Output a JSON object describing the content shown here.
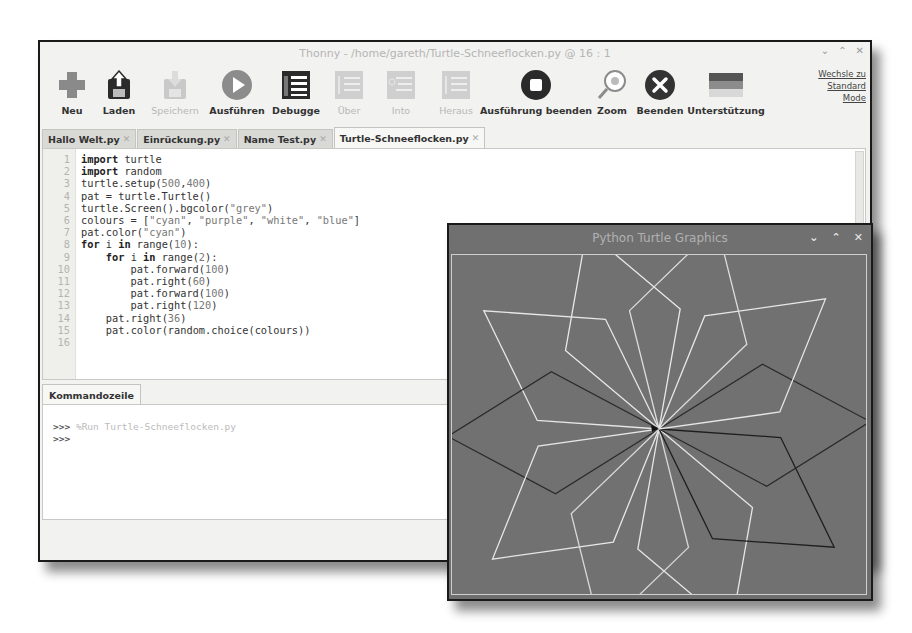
{
  "thonny": {
    "title": "Thonny  -  /home/gareth/Turtle-Schneeflocken.py  @  16 : 1",
    "window_controls": {
      "minimize": "⌄",
      "maximize": "⌃",
      "close": "✕"
    },
    "mode_link": [
      "Wechsle zu",
      "Standard",
      "Mode"
    ],
    "toolbar": [
      {
        "id": "new",
        "label": "Neu",
        "icon": "plus-icon",
        "enabled": true
      },
      {
        "id": "load",
        "label": "Laden",
        "icon": "load-icon",
        "enabled": true
      },
      {
        "id": "save",
        "label": "Speichern",
        "icon": "save-icon",
        "enabled": false
      },
      {
        "id": "run",
        "label": "Ausführen",
        "icon": "play-icon",
        "enabled": true
      },
      {
        "id": "debug",
        "label": "Debugge",
        "icon": "debug-icon",
        "enabled": true
      },
      {
        "id": "step-over",
        "label": "Über",
        "icon": "step-over-icon",
        "enabled": false
      },
      {
        "id": "step-into",
        "label": "Into",
        "icon": "step-into-icon",
        "enabled": false
      },
      {
        "id": "step-out",
        "label": "Heraus",
        "icon": "step-out-icon",
        "enabled": false
      },
      {
        "id": "stop",
        "label": "Ausführung beenden",
        "icon": "stop-icon",
        "enabled": true
      },
      {
        "id": "zoom",
        "label": "Zoom",
        "icon": "zoom-icon",
        "enabled": true
      },
      {
        "id": "quit",
        "label": "Beenden",
        "icon": "quit-icon",
        "enabled": true
      },
      {
        "id": "support",
        "label": "Unterstützung",
        "icon": "flag-icon",
        "enabled": true
      }
    ],
    "tabs": [
      {
        "label": "Hallo Welt.py",
        "active": false
      },
      {
        "label": "Einrückung.py",
        "active": false
      },
      {
        "label": "Name Test.py",
        "active": false
      },
      {
        "label": "Turtle-Schneeflocken.py",
        "active": true
      }
    ],
    "tab_close_glyph": "✕",
    "editor": {
      "line_numbers": [
        "1",
        "2",
        "3",
        "4",
        "5",
        "6",
        "7",
        "8",
        "9",
        "10",
        "11",
        "12",
        "13",
        "14",
        "15",
        "16"
      ],
      "lines": [
        "import turtle",
        "import random",
        "turtle.setup(500,400)",
        "pat = turtle.Turtle()",
        "turtle.Screen().bgcolor(\"grey\")",
        "colours = [\"cyan\", \"purple\", \"white\", \"blue\"]",
        "pat.color(\"cyan\")",
        "for i in range(10):",
        "    for i in range(2):",
        "        pat.forward(100)",
        "        pat.right(60)",
        "        pat.forward(100)",
        "        pat.right(120)",
        "    pat.right(36)",
        "    pat.color(random.choice(colours))",
        ""
      ]
    },
    "shell": {
      "tab_label": "Kommandozeile",
      "prompt": ">>>",
      "lines": [
        {
          "prompt": ">>>",
          "text": "%Run Turtle-Schneeflocken.py"
        },
        {
          "prompt": ">>>",
          "text": ""
        }
      ]
    }
  },
  "turtle_window": {
    "title": "Python Turtle Graphics",
    "window_controls": {
      "minimize": "⌄",
      "maximize": "⌃",
      "close": "✕"
    },
    "background": "#717171",
    "petals": [
      {
        "angle": 0,
        "color": "#e8e8e8"
      },
      {
        "angle": 36,
        "color": "#e6e6e6"
      },
      {
        "angle": 72,
        "color": "#2a2a2a"
      },
      {
        "angle": 108,
        "color": "#e6e6e6"
      },
      {
        "angle": 144,
        "color": "#d8d8d8"
      },
      {
        "angle": 180,
        "color": "#e6e6e6"
      },
      {
        "angle": 216,
        "color": "#1e1e1e"
      },
      {
        "angle": 252,
        "color": "#2a2a2a"
      },
      {
        "angle": 288,
        "color": "#e6e6e6"
      },
      {
        "angle": 324,
        "color": "#dcdcdc"
      }
    ]
  }
}
